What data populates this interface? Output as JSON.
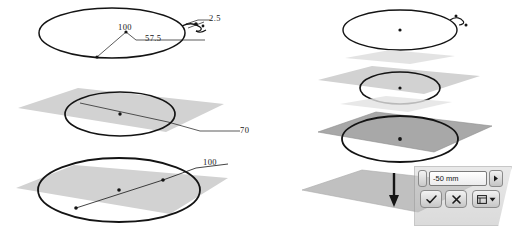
{
  "scene": {
    "title": "Loft / extrude construction planes with sketch profiles",
    "stroke_color": "#141414",
    "plane_light": "#d2d2d2",
    "plane_dark": "#a8a8a8",
    "plane_mid": "#c0c0c0"
  },
  "left_column": {
    "top_view": {
      "name": "top-profile-ellipse",
      "dimensions": [
        {
          "id": "dim-100",
          "value": "100"
        },
        {
          "id": "dim-57-5",
          "value": "57.5"
        },
        {
          "id": "dim-2-5",
          "value": "2.5"
        }
      ]
    },
    "middle_view": {
      "name": "middle-plane-circle",
      "dimensions": [
        {
          "id": "dim-70",
          "value": "70"
        }
      ]
    },
    "bottom_view": {
      "name": "bottom-plane-circle",
      "dimensions": [
        {
          "id": "dim-100-bottom",
          "value": "100"
        }
      ]
    }
  },
  "right_column": {
    "view_1": {
      "name": "profile-ellipse-plain",
      "shade": "none"
    },
    "view_2": {
      "name": "plane-circle-light",
      "shade": "light"
    },
    "view_3": {
      "name": "plane-circle-selected",
      "shade": "dark"
    },
    "view_4": {
      "name": "plane-direction-arrow",
      "shade": "mid",
      "arrow": "down"
    }
  },
  "dialog": {
    "name": "offset-distance-toolbar",
    "distance_value": "-50 mm",
    "distance_placeholder": "distance",
    "spin_up_down_icon": "spinner-icon",
    "stepper_icon": "chevron-right-icon",
    "ok_label": "✓",
    "cancel_label": "✕",
    "options_label": "▾",
    "options_icon": "list-options-icon"
  }
}
